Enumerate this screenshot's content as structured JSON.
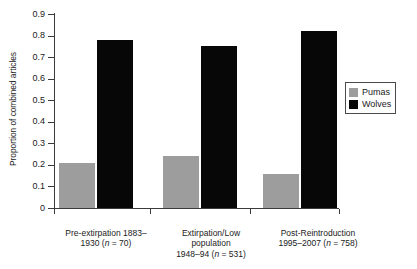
{
  "chart_data": {
    "type": "bar",
    "title": "",
    "xlabel": "",
    "ylabel": "Proportion of combined articles",
    "ylim": [
      0,
      0.9
    ],
    "yticks": [
      "0",
      "0.1",
      "0.2",
      "0.3",
      "0.4",
      "0.5",
      "0.6",
      "0.7",
      "0.8",
      "0.9"
    ],
    "ytick_values": [
      0,
      0.1,
      0.2,
      0.3,
      0.4,
      0.5,
      0.6,
      0.7,
      0.8,
      0.9
    ],
    "grid": false,
    "legend_position": "right",
    "categories": [
      "Pre-extirpation 1883–1930 (n = 70)",
      "Extirpation/Low population 1948–94 (n = 531)",
      "Post-Reintroduction 1995–2007 (n = 758)"
    ],
    "category_lines": [
      [
        "Pre-extirpation 1883–",
        "1930 (n = 70)"
      ],
      [
        "Extirpation/Low",
        "population",
        "1948–94 (n = 531)"
      ],
      [
        "Post-Reintroduction",
        "1995–2007 (n = 758)"
      ]
    ],
    "series": [
      {
        "name": "Pumas",
        "color": "#9d9d9d",
        "values": [
          0.21,
          0.24,
          0.16
        ]
      },
      {
        "name": "Wolves",
        "color": "#070707",
        "values": [
          0.78,
          0.75,
          0.82
        ]
      }
    ]
  },
  "legend": {
    "items": [
      {
        "label": "Pumas",
        "swatch": "legend-swatch-pumas"
      },
      {
        "label": "Wolves",
        "swatch": "legend-swatch-wolves"
      }
    ]
  },
  "axis": {
    "y_title": "Proportion of combined articles"
  },
  "xcat_labels": {
    "g1l1": "Pre-extirpation 1883–",
    "g1l2a": "1930 (",
    "g1l2i": "n",
    "g1l2b": " = 70)",
    "g2l1": "Extirpation/Low",
    "g2l2": "population",
    "g2l3a": "1948–94 (",
    "g2l3i": "n",
    "g2l3b": " = 531)",
    "g3l1": "Post-Reintroduction",
    "g3l2a": "1995–2007 (",
    "g3l2i": "n",
    "g3l2b": " = 758)"
  }
}
